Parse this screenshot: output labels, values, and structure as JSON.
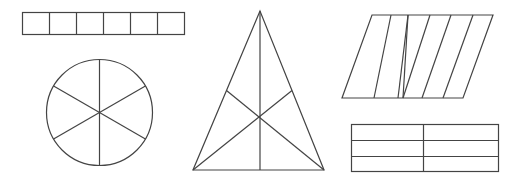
{
  "diagram": {
    "stroke_color": "#444444",
    "background": "#ffffff",
    "shapes": [
      {
        "name": "rectangle-strip",
        "parts": 6,
        "division": "equal vertical columns"
      },
      {
        "name": "circle",
        "parts": 6,
        "division": "equal sectors"
      },
      {
        "name": "triangle",
        "parts": 6,
        "division": "three medians"
      },
      {
        "name": "parallelogram",
        "parts": 6,
        "division": "unequal slanted strips"
      },
      {
        "name": "rectangle-grid",
        "parts": 6,
        "division": "2 columns x 3 rows"
      }
    ]
  }
}
